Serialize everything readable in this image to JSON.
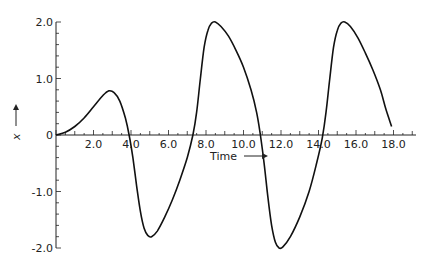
{
  "chart_data": {
    "type": "line",
    "title": "",
    "xlabel": "Time",
    "ylabel": "x",
    "xlim": [
      0,
      19
    ],
    "ylim": [
      -2.0,
      2.0
    ],
    "grid": false,
    "legend": null,
    "x_ticks": [
      2.0,
      4.0,
      6.0,
      8.0,
      10.0,
      12.0,
      14.0,
      16.0,
      18.0
    ],
    "x_tick_labels": [
      "2.0",
      "4.0",
      "6.0",
      "8.0",
      "10.0",
      "12.0",
      "14.0",
      "16.0",
      "18.0"
    ],
    "y_ticks": [
      2.0,
      1.0,
      0,
      -1.0,
      -2.0
    ],
    "y_tick_labels": [
      "2.0",
      "1.0",
      "0",
      "-1.0",
      "-2.0"
    ],
    "series": [
      {
        "name": "x(t)",
        "color": "#111111",
        "x": [
          0,
          0.5,
          1.0,
          1.5,
          2.0,
          2.5,
          2.8,
          3.1,
          3.4,
          3.7,
          3.9,
          4.1,
          4.3,
          4.5,
          4.7,
          4.9,
          5.1,
          5.4,
          5.8,
          6.2,
          6.6,
          7.0,
          7.3,
          7.5,
          7.7,
          7.9,
          8.1,
          8.3,
          8.5,
          8.8,
          9.2,
          9.6,
          10.0,
          10.4,
          10.7,
          10.9,
          11.1,
          11.3,
          11.5,
          11.7,
          11.9,
          12.1,
          12.5,
          13.0,
          13.5,
          13.9,
          14.2,
          14.4,
          14.6,
          14.8,
          15.0,
          15.2,
          15.4,
          15.7,
          16.1,
          16.5,
          16.9,
          17.3,
          17.6,
          17.9
        ],
        "y": [
          0,
          0.05,
          0.15,
          0.3,
          0.5,
          0.7,
          0.78,
          0.75,
          0.6,
          0.3,
          0.0,
          -0.4,
          -0.9,
          -1.35,
          -1.65,
          -1.78,
          -1.8,
          -1.7,
          -1.45,
          -1.15,
          -0.8,
          -0.4,
          0.0,
          0.4,
          1.0,
          1.55,
          1.85,
          1.98,
          2.0,
          1.92,
          1.75,
          1.5,
          1.2,
          0.8,
          0.4,
          0.0,
          -0.5,
          -1.1,
          -1.6,
          -1.9,
          -2.0,
          -1.98,
          -1.8,
          -1.45,
          -1.0,
          -0.5,
          -0.05,
          0.4,
          1.0,
          1.55,
          1.85,
          1.98,
          2.0,
          1.92,
          1.72,
          1.45,
          1.15,
          0.8,
          0.45,
          0.15
        ]
      }
    ]
  }
}
